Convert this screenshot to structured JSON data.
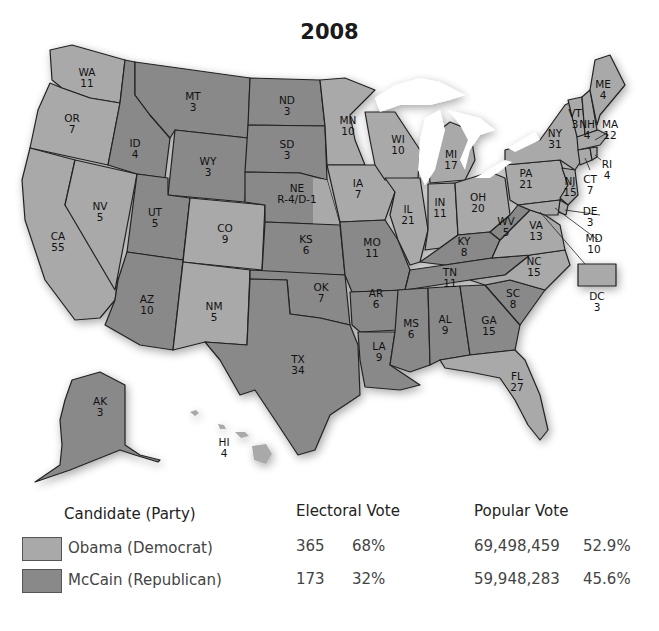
{
  "title": "2008",
  "colors": {
    "democrat": "#a9a9a9",
    "republican": "#898989",
    "lakes": "#ffffff",
    "border": "#222222"
  },
  "legend": {
    "headers": {
      "candidate": "Candidate (Party)",
      "electoral": "Electoral Vote",
      "popular": "Popular Vote"
    },
    "rows": [
      {
        "candidate": "Obama (Democrat)",
        "party": "democrat",
        "electoral_votes": "365",
        "electoral_pct": "68%",
        "popular_votes": "69,498,459",
        "popular_pct": "52.9%"
      },
      {
        "candidate": "McCain (Republican)",
        "party": "republican",
        "electoral_votes": "173",
        "electoral_pct": "32%",
        "popular_votes": "59,948,283",
        "popular_pct": "45.6%"
      }
    ]
  },
  "states": {
    "WA": {
      "abbr": "WA",
      "ev": "11",
      "winner": "democrat"
    },
    "OR": {
      "abbr": "OR",
      "ev": "7",
      "winner": "democrat"
    },
    "CA": {
      "abbr": "CA",
      "ev": "55",
      "winner": "democrat"
    },
    "NV": {
      "abbr": "NV",
      "ev": "5",
      "winner": "democrat"
    },
    "ID": {
      "abbr": "ID",
      "ev": "4",
      "winner": "republican"
    },
    "MT": {
      "abbr": "MT",
      "ev": "3",
      "winner": "republican"
    },
    "WY": {
      "abbr": "WY",
      "ev": "3",
      "winner": "republican"
    },
    "UT": {
      "abbr": "UT",
      "ev": "5",
      "winner": "republican"
    },
    "AZ": {
      "abbr": "AZ",
      "ev": "10",
      "winner": "republican"
    },
    "CO": {
      "abbr": "CO",
      "ev": "9",
      "winner": "democrat"
    },
    "NM": {
      "abbr": "NM",
      "ev": "5",
      "winner": "democrat"
    },
    "ND": {
      "abbr": "ND",
      "ev": "3",
      "winner": "republican"
    },
    "SD": {
      "abbr": "SD",
      "ev": "3",
      "winner": "republican"
    },
    "NE": {
      "abbr": "NE",
      "ev": "R-4/D-1",
      "winner": "split"
    },
    "KS": {
      "abbr": "KS",
      "ev": "6",
      "winner": "republican"
    },
    "OK": {
      "abbr": "OK",
      "ev": "7",
      "winner": "republican"
    },
    "TX": {
      "abbr": "TX",
      "ev": "34",
      "winner": "republican"
    },
    "MN": {
      "abbr": "MN",
      "ev": "10",
      "winner": "democrat"
    },
    "IA": {
      "abbr": "IA",
      "ev": "7",
      "winner": "democrat"
    },
    "MO": {
      "abbr": "MO",
      "ev": "11",
      "winner": "republican"
    },
    "AR": {
      "abbr": "AR",
      "ev": "6",
      "winner": "republican"
    },
    "LA": {
      "abbr": "LA",
      "ev": "9",
      "winner": "republican"
    },
    "WI": {
      "abbr": "WI",
      "ev": "10",
      "winner": "democrat"
    },
    "IL": {
      "abbr": "IL",
      "ev": "21",
      "winner": "democrat"
    },
    "MI": {
      "abbr": "MI",
      "ev": "17",
      "winner": "democrat"
    },
    "IN": {
      "abbr": "IN",
      "ev": "11",
      "winner": "democrat"
    },
    "OH": {
      "abbr": "OH",
      "ev": "20",
      "winner": "democrat"
    },
    "KY": {
      "abbr": "KY",
      "ev": "8",
      "winner": "republican"
    },
    "TN": {
      "abbr": "TN",
      "ev": "11",
      "winner": "republican"
    },
    "MS": {
      "abbr": "MS",
      "ev": "6",
      "winner": "republican"
    },
    "AL": {
      "abbr": "AL",
      "ev": "9",
      "winner": "republican"
    },
    "GA": {
      "abbr": "GA",
      "ev": "15",
      "winner": "republican"
    },
    "FL": {
      "abbr": "FL",
      "ev": "27",
      "winner": "democrat"
    },
    "SC": {
      "abbr": "SC",
      "ev": "8",
      "winner": "republican"
    },
    "NC": {
      "abbr": "NC",
      "ev": "15",
      "winner": "democrat"
    },
    "VA": {
      "abbr": "VA",
      "ev": "13",
      "winner": "democrat"
    },
    "WV": {
      "abbr": "WV",
      "ev": "5",
      "winner": "republican"
    },
    "PA": {
      "abbr": "PA",
      "ev": "21",
      "winner": "democrat"
    },
    "NY": {
      "abbr": "NY",
      "ev": "31",
      "winner": "democrat"
    },
    "VT": {
      "abbr": "VT",
      "ev": "3",
      "winner": "democrat"
    },
    "NH": {
      "abbr": "NH",
      "ev": "4",
      "winner": "democrat"
    },
    "ME": {
      "abbr": "ME",
      "ev": "4",
      "winner": "democrat"
    },
    "MA": {
      "abbr": "MA",
      "ev": "12",
      "winner": "democrat"
    },
    "RI": {
      "abbr": "RI",
      "ev": "4",
      "winner": "democrat"
    },
    "CT": {
      "abbr": "CT",
      "ev": "7",
      "winner": "democrat"
    },
    "NJ": {
      "abbr": "NJ",
      "ev": "15",
      "winner": "democrat"
    },
    "DE": {
      "abbr": "DE",
      "ev": "3",
      "winner": "democrat"
    },
    "MD": {
      "abbr": "MD",
      "ev": "10",
      "winner": "democrat"
    },
    "DC": {
      "abbr": "DC",
      "ev": "3",
      "winner": "democrat"
    },
    "AK": {
      "abbr": "AK",
      "ev": "3",
      "winner": "republican"
    },
    "HI": {
      "abbr": "HI",
      "ev": "4",
      "winner": "democrat"
    }
  }
}
